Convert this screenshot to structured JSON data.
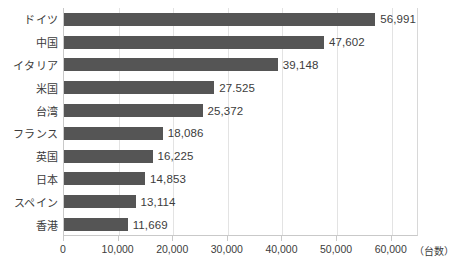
{
  "chart_data": {
    "type": "bar",
    "orientation": "horizontal",
    "title": "",
    "subtitle": "",
    "xlabel": "",
    "ylabel": "",
    "unit_label": "（台数）",
    "categories": [
      "ドイツ",
      "中国",
      "イタリア",
      "米国",
      "台湾",
      "フランス",
      "英国",
      "日本",
      "スペイン",
      "香港"
    ],
    "values": [
      56991,
      47602,
      39148,
      27525,
      25372,
      18086,
      16225,
      14853,
      13114,
      11669
    ],
    "value_labels": [
      "56,991",
      "47,602",
      "39,148",
      "27.525",
      "25,372",
      "18,086",
      "16,225",
      "14,853",
      "13,114",
      "11,669"
    ],
    "xlim": [
      0,
      65000
    ],
    "xticks": [
      0,
      10000,
      20000,
      30000,
      40000,
      50000,
      60000
    ],
    "xtick_labels": [
      "0",
      "10,000",
      "20,000",
      "30,000",
      "40,000",
      "50,000",
      "60,000"
    ],
    "grid": true,
    "grid_axis": "x",
    "legend": false,
    "bar_color": "#555555",
    "grid_color": "#e3e3e3",
    "frame_color": "#c9c9c9",
    "text_color": "#3c3c3c",
    "background_color": "#ffffff"
  }
}
